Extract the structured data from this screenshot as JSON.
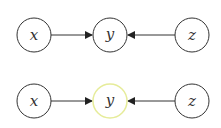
{
  "diagrams": [
    {
      "nodes": [
        {
          "id": "x",
          "label": "x",
          "cx": 34,
          "cy": 35,
          "stroke": "#333333"
        },
        {
          "id": "y",
          "label": "y",
          "cx": 110,
          "cy": 35,
          "stroke": "#333333"
        },
        {
          "id": "z",
          "label": "z",
          "cx": 192,
          "cy": 35,
          "stroke": "#333333"
        }
      ],
      "edges": [
        {
          "from": "x",
          "to": "y"
        },
        {
          "from": "z",
          "to": "y"
        }
      ]
    },
    {
      "nodes": [
        {
          "id": "x",
          "label": "x",
          "cx": 34,
          "cy": 101,
          "stroke": "#333333"
        },
        {
          "id": "y",
          "label": "y",
          "cx": 110,
          "cy": 101,
          "stroke": "#e6ec9a",
          "highlighted": true
        },
        {
          "id": "z",
          "label": "z",
          "cx": 192,
          "cy": 101,
          "stroke": "#333333"
        }
      ],
      "edges": [
        {
          "from": "x",
          "to": "y"
        },
        {
          "from": "z",
          "to": "y"
        }
      ]
    }
  ],
  "labels": {
    "top": {
      "x": "x",
      "y": "y",
      "z": "z"
    },
    "bottom": {
      "x": "x",
      "y": "y",
      "z": "z"
    }
  }
}
